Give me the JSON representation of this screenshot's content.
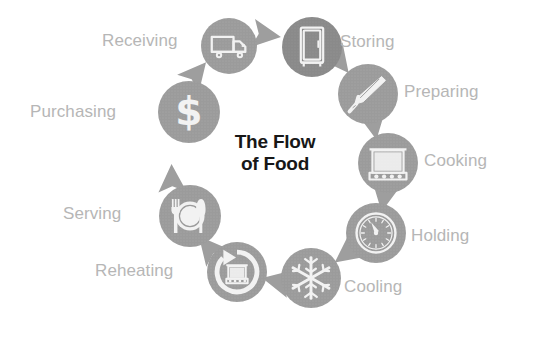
{
  "diagram": {
    "title_line1": "The Flow",
    "title_line2": "of Food",
    "type": "cycle",
    "colors": {
      "circle_fill": "#9b9b9b",
      "circle_fill_dark": "#8a8a8a",
      "icon_fill": "#f2f2f2",
      "label_text": "#b6b6b6",
      "title_text": "#171717",
      "arrow_fill": "#9e9e9e",
      "background": "#ffffff"
    },
    "stages": [
      {
        "id": "purchasing",
        "label": "Purchasing",
        "icon": "dollar-sign-icon",
        "order": 1,
        "label_side": "left",
        "cx": 189,
        "cy": 112,
        "r": 31,
        "label_x": 30,
        "label_y": 103
      },
      {
        "id": "receiving",
        "label": "Receiving",
        "icon": "delivery-truck-icon",
        "order": 2,
        "label_side": "left",
        "cx": 229,
        "cy": 46,
        "r": 28,
        "label_x": 102,
        "label_y": 32
      },
      {
        "id": "storing",
        "label": "Storing",
        "icon": "refrigerator-icon",
        "order": 3,
        "label_side": "right",
        "cx": 312,
        "cy": 47,
        "r": 30,
        "label_x": 340,
        "label_y": 33
      },
      {
        "id": "preparing",
        "label": "Preparing",
        "icon": "chef-knife-icon",
        "order": 4,
        "label_side": "right",
        "cx": 368,
        "cy": 94,
        "r": 30,
        "label_x": 404,
        "label_y": 83
      },
      {
        "id": "cooking",
        "label": "Cooking",
        "icon": "stove-oven-icon",
        "order": 5,
        "label_side": "right",
        "cx": 388,
        "cy": 163,
        "r": 30,
        "label_x": 424,
        "label_y": 152
      },
      {
        "id": "holding",
        "label": "Holding",
        "icon": "temperature-gauge-icon",
        "order": 6,
        "label_side": "right",
        "cx": 376,
        "cy": 233,
        "r": 30,
        "label_x": 411,
        "label_y": 227
      },
      {
        "id": "cooling",
        "label": "Cooling",
        "icon": "snowflake-icon",
        "order": 7,
        "label_side": "right",
        "cx": 311,
        "cy": 278,
        "r": 30,
        "label_x": 344,
        "label_y": 278
      },
      {
        "id": "reheating",
        "label": "Reheating",
        "icon": "reheat-cycle-icon",
        "order": 8,
        "label_side": "left",
        "cx": 237,
        "cy": 272,
        "r": 30,
        "label_x": 95,
        "label_y": 262
      },
      {
        "id": "serving",
        "label": "Serving",
        "icon": "plate-cutlery-icon",
        "order": 9,
        "label_side": "left",
        "cx": 190,
        "cy": 216,
        "r": 31,
        "label_x": 63,
        "label_y": 205
      }
    ],
    "arrows": [
      {
        "from": "purchasing",
        "to": "receiving",
        "x": 197,
        "y": 73,
        "rot": 310
      },
      {
        "from": "receiving",
        "to": "storing",
        "x": 267,
        "y": 35,
        "rot": 8
      },
      {
        "from": "storing",
        "to": "preparing",
        "x": 340,
        "y": 62,
        "rot": 52
      },
      {
        "from": "preparing",
        "to": "cooking",
        "x": 374,
        "y": 126,
        "rot": 80
      },
      {
        "from": "cooking",
        "to": "holding",
        "x": 384,
        "y": 198,
        "rot": 100
      },
      {
        "from": "holding",
        "to": "cooling",
        "x": 346,
        "y": 254,
        "rot": 143
      },
      {
        "from": "cooling",
        "to": "reheating",
        "x": 276,
        "y": 281,
        "rot": 192
      },
      {
        "from": "reheating",
        "to": "serving",
        "x": 208,
        "y": 247,
        "rot": 230
      },
      {
        "from": "serving",
        "to": "purchasing",
        "x": 172,
        "y": 178,
        "rot": 268
      }
    ]
  }
}
